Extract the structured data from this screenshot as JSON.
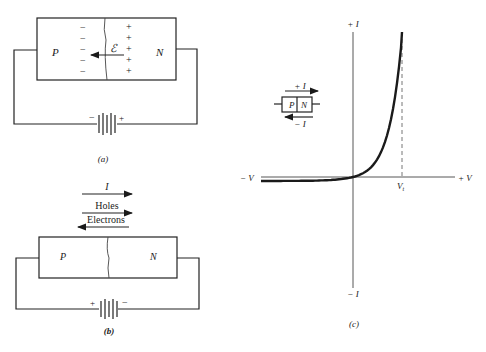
{
  "figure_a": {
    "p_label": "P",
    "n_label": "N",
    "minus_sign": "−",
    "plus_sign": "+",
    "field_label": "ℰ",
    "battery_minus": "−",
    "battery_plus": "+",
    "caption": "(a)"
  },
  "figure_b": {
    "current_label": "I",
    "holes_label": "Holes",
    "electrons_label": "Electrons",
    "p_label": "P",
    "n_label": "N",
    "battery_plus": "+",
    "battery_minus": "−",
    "caption": "(b)"
  },
  "figure_c": {
    "pos_i_label": "+ I",
    "neg_i_label": "− I",
    "neg_v_label": "− V",
    "pos_v_label": "+ V",
    "threshold_label": "V",
    "threshold_sub": "t",
    "inset_pos_i": "+ I",
    "inset_neg_i": "− I",
    "inset_p": "P",
    "inset_n": "N",
    "caption": "(c)"
  },
  "chart_data": {
    "type": "line",
    "title": "",
    "xlabel_left": "− V",
    "xlabel_right": "+ V",
    "ylabel_top": "+ I",
    "ylabel_bottom": "− I",
    "x_marker": "Vt",
    "series": [
      {
        "name": "diode I-V curve",
        "shape": "exponential forward conduction, small reverse saturation current"
      }
    ],
    "grid": false
  }
}
